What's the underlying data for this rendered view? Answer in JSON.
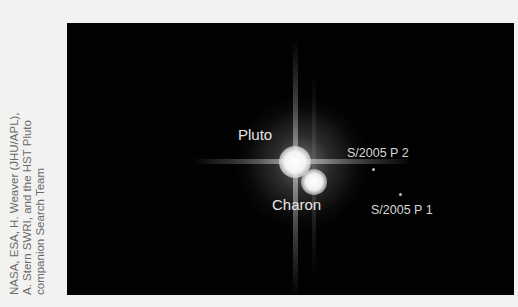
{
  "credit": {
    "lines": [
      "NASA, ESA, H. Weaver (JHU/APL),",
      "A. Stern SWRI, and the HST Pluto",
      "companion Search Team"
    ]
  },
  "photo": {
    "labels": {
      "pluto": "Pluto",
      "charon": "Charon",
      "p2": "S/2005 P 2",
      "p1": "S/2005 P 1"
    }
  }
}
